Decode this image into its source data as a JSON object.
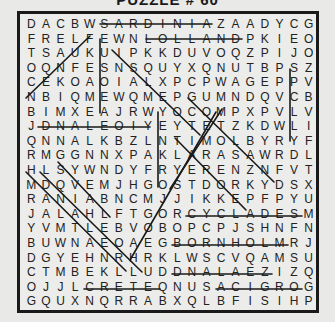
{
  "title": "PUZZLE # 60",
  "grid": [
    "DACBWSARDINIAZAADYCG",
    "FRELFEWNLOLLANDPKIEO",
    "TSAUKUIPKKDUVOQZPIJO",
    "OQNFESNSQUYXQNUTBPSZ",
    "CEKOAOIALXPCPWAGEPPV",
    "NBIQMEWQMEPGUMNDQVCB",
    "BIMXEAJRWYOCOMPXPVLV",
    "JDNALEOIYEYTETZKDWLI",
    "QNNALKBZLNTIMOLBYRYF",
    "RMGGNNXPAKLARASAWRDL",
    "HLSYWNDYFRYERENZNFVT",
    "MDQVEMJHGOSTDORKYDSX",
    "RANIABNCMJJIKKEPFPYU",
    "JALAHLFTGORCYCLADESM",
    "YVMTLEBVOBOPCPJSHNFN",
    "BUWNAEOAEGBORNHOLMRJ",
    "DGYEHNRHRKLWSCVQAMSU",
    "CTMBEKLLUDDNALAEZIZQ",
    "OJJLCRETEQNUSACIGROG",
    "GQUXNQRRABXQLBFISIHP"
  ],
  "found_words": [
    "SARDINIA",
    "HOLLAND",
    "CYCLADES",
    "BORNHOLM",
    "DNALAEZ",
    "CRETE",
    "ACIGROC",
    "DNALEOI"
  ],
  "line_color": "#1a1a1a"
}
